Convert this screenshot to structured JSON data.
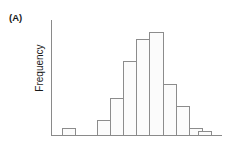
{
  "figure": {
    "panel_label": "(A)",
    "y_axis_title": "Frequency",
    "x_axis_title": "",
    "title": ""
  },
  "style": {
    "bar_fill": "#fbfbfb",
    "bar_stroke": "#8c8c8c",
    "axis_color": "#8a8a8a",
    "text_color": "#1a1a1a",
    "background": "#ffffff"
  },
  "chart_data": {
    "type": "bar",
    "title": "(A)",
    "xlabel": "",
    "ylabel": "Frequency",
    "categories": [
      "1",
      "2",
      "3",
      "4",
      "5",
      "6",
      "7",
      "8",
      "9",
      "10",
      "11",
      "12",
      "13"
    ],
    "values": [
      1,
      0,
      0,
      2,
      5,
      10,
      13,
      14,
      7,
      4,
      1,
      0.6,
      0
    ],
    "ylim": [
      0,
      15
    ],
    "grid": false,
    "legend": null,
    "tick_labels_x": [],
    "tick_labels_y": []
  },
  "geometry": {
    "axis_x": 51.5,
    "baseline_y": 135.5,
    "axis_top_y": 20,
    "axis_right_x": 222,
    "bar_width": 13.2,
    "bar_left_starts": [
      62,
      75.2,
      88.4,
      97.0,
      110.2,
      123.4,
      136.6,
      149.8,
      163.0,
      176.2,
      189.4,
      198.6,
      205.0
    ],
    "max_bar_height": 103
  }
}
